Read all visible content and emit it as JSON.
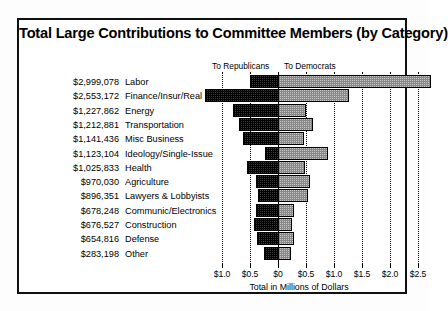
{
  "chart_data": {
    "type": "bar",
    "subtype": "diverging-horizontal-stacked",
    "title": "Total Large Contributions to Committee Members (by Category)",
    "xlabel": "Total in Millions of Dollars",
    "ylabel": "",
    "grid": true,
    "legend_position": "top",
    "legend": [
      {
        "name": "To Republicans",
        "direction": "left",
        "fill": "dark-crosshatch"
      },
      {
        "name": "To Democrats",
        "direction": "right",
        "fill": "light-crosshatch"
      }
    ],
    "axis": {
      "tick_values": [
        -1.0,
        -0.5,
        0,
        0.5,
        1.0,
        1.5,
        2.0,
        2.5
      ],
      "tick_labels": [
        "$1.0",
        "$0.5",
        "$0",
        "$0.5",
        "$1.0",
        "$1.5",
        "$2.0",
        "$2.5"
      ],
      "xlim": [
        -1.15,
        2.62
      ],
      "units": "millions of dollars"
    },
    "categories": [
      "Labor",
      "Finance/Insur/Real Est",
      "Energy",
      "Transportation",
      "Misc Business",
      "Ideology/Single-Issue",
      "Health",
      "Agriculture",
      "Lawyers & Lobbyists",
      "Communic/Electronics",
      "Construction",
      "Defense",
      "Other"
    ],
    "totals_labels": [
      "$2,999,078",
      "$2,553,172",
      "$1,227,862",
      "$1,212,881",
      "$1,141,436",
      "$1,123,104",
      "$1,025,833",
      "$970,030",
      "$896,351",
      "$678,248",
      "$676,527",
      "$654,816",
      "$283,198"
    ],
    "totals": [
      2999078,
      2553172,
      1227862,
      1212881,
      1141436,
      1123104,
      1025833,
      970030,
      896351,
      678248,
      676527,
      654816,
      283198
    ],
    "series": [
      {
        "name": "To Republicans",
        "values": [
          0.5,
          1.3,
          0.8,
          0.7,
          0.62,
          0.23,
          0.55,
          0.4,
          0.36,
          0.4,
          0.42,
          0.38,
          0.25
        ]
      },
      {
        "name": "To Democrats",
        "values": [
          2.73,
          1.27,
          0.5,
          0.62,
          0.46,
          0.9,
          0.48,
          0.57,
          0.54,
          0.28,
          0.25,
          0.28,
          0.23
        ]
      }
    ]
  },
  "colors": {
    "republican_fill": "#3a3a3a",
    "democrat_fill": "#c8c8c8",
    "frame": "#101010",
    "background": "#ffffff"
  }
}
